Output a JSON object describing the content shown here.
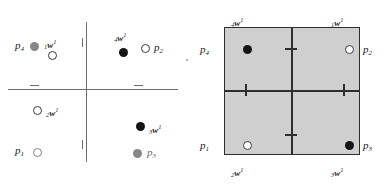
{
  "figure": {
    "title": ""
  },
  "colors": {
    "axis": "#6e6e6e",
    "square_fill": "#cfcfcf",
    "square_border": "#2e2e2e",
    "marker_black": "#141414",
    "marker_gray": "#878787",
    "marker_open_stroke": "#3a3a3a",
    "text": "#1a1a1a"
  },
  "left_panel": {
    "name": "cartesian-axes-panel",
    "markers": [
      {
        "id": "p4-marker",
        "style": "filled-gray",
        "x": 30,
        "y": 42
      },
      {
        "id": "w1-marker",
        "style": "open",
        "x": 48,
        "y": 51
      },
      {
        "id": "w4-marker",
        "style": "filled-black",
        "x": 119,
        "y": 48
      },
      {
        "id": "p2-marker",
        "style": "open",
        "x": 141,
        "y": 44
      },
      {
        "id": "w2-marker",
        "style": "open",
        "x": 33,
        "y": 106
      },
      {
        "id": "w3-marker",
        "style": "filled-black",
        "x": 136,
        "y": 122
      },
      {
        "id": "p1-marker",
        "style": "open-gray",
        "x": 33,
        "y": 148
      },
      {
        "id": "p3-marker",
        "style": "filled-gray",
        "x": 133,
        "y": 149
      }
    ],
    "labels": [
      {
        "id": "label-p4",
        "text": "p",
        "sub": "4",
        "sup": "",
        "kind": "p",
        "x": 15,
        "y": 40
      },
      {
        "id": "label-w1",
        "text": "w",
        "sub": "1",
        "sup": "1",
        "kind": "w",
        "x": 44,
        "y": 39
      },
      {
        "id": "label-w4",
        "text": "w",
        "sub": "4",
        "sup": "1",
        "kind": "w",
        "x": 114,
        "y": 32
      },
      {
        "id": "label-p2",
        "text": "p",
        "sub": "2",
        "sup": "",
        "kind": "p",
        "x": 154,
        "y": 42
      },
      {
        "id": "label-w2",
        "text": "w",
        "sub": "2",
        "sup": "1",
        "kind": "w",
        "x": 46,
        "y": 107
      },
      {
        "id": "label-w3",
        "text": "w",
        "sub": "3",
        "sup": "1",
        "kind": "w",
        "x": 149,
        "y": 124
      },
      {
        "id": "label-p1",
        "text": "p",
        "sub": "1",
        "sup": "",
        "kind": "p",
        "x": 15,
        "y": 145
      },
      {
        "id": "label-p3",
        "text": "p",
        "sub": "3",
        "sup": "",
        "kind": "p",
        "x": 147,
        "y": 147
      }
    ]
  },
  "right_panel": {
    "name": "shaded-square-panel",
    "markers": [
      {
        "id": "p4-marker-sq",
        "style": "filled-black",
        "x": 243,
        "y": 45
      },
      {
        "id": "p2-marker-sq",
        "style": "open",
        "x": 345,
        "y": 45
      },
      {
        "id": "p1-marker-sq",
        "style": "open",
        "x": 243,
        "y": 141
      },
      {
        "id": "p3-marker-sq",
        "style": "filled-black",
        "x": 345,
        "y": 141
      }
    ],
    "labels": [
      {
        "id": "label-w4-sq",
        "text": "w",
        "sub": "4",
        "sup": "1",
        "kind": "w",
        "x": 231,
        "y": 17
      },
      {
        "id": "label-w1-sq",
        "text": "w",
        "sub": "1",
        "sup": "1",
        "kind": "w",
        "x": 331,
        "y": 17
      },
      {
        "id": "label-w2-sq",
        "text": "w",
        "sub": "2",
        "sup": "1",
        "kind": "w",
        "x": 231,
        "y": 167
      },
      {
        "id": "label-w3-sq",
        "text": "w",
        "sub": "3",
        "sup": "1",
        "kind": "w",
        "x": 331,
        "y": 167
      },
      {
        "id": "label-p4-sq",
        "text": "p",
        "sub": "4",
        "sup": "",
        "kind": "p",
        "x": 200,
        "y": 44
      },
      {
        "id": "label-p2-sq",
        "text": "p",
        "sub": "2",
        "sup": "",
        "kind": "p",
        "x": 363,
        "y": 44
      },
      {
        "id": "label-p1-sq",
        "text": "p",
        "sub": "1",
        "sup": "",
        "kind": "p",
        "x": 200,
        "y": 140
      },
      {
        "id": "label-p3-sq",
        "text": "p",
        "sub": "3",
        "sup": "",
        "kind": "p",
        "x": 363,
        "y": 140
      }
    ]
  }
}
